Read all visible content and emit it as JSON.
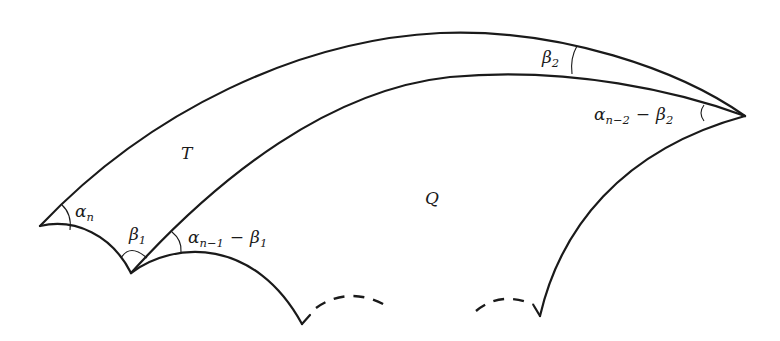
{
  "figure": {
    "regions": [
      {
        "id": "T",
        "label": "T"
      },
      {
        "id": "Q",
        "label": "Q"
      }
    ],
    "angles": {
      "alpha_n": {
        "base": "α",
        "sub": "n",
        "rest_op": "",
        "rest_base": "",
        "rest_sub": ""
      },
      "beta_1": {
        "base": "β",
        "sub": "1"
      },
      "alpha_n1": {
        "base": "α",
        "sub": "n−1",
        "op": "−",
        "base2": "β",
        "sub2": "1"
      },
      "beta_2": {
        "base": "β",
        "sub": "2"
      },
      "alpha_n2": {
        "base": "α",
        "sub": "n−2",
        "op": "−",
        "base2": "β",
        "sub2": "2"
      }
    },
    "colors": {
      "stroke": "#1a1a1a",
      "background": "#ffffff"
    }
  }
}
